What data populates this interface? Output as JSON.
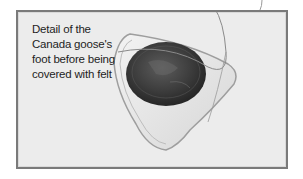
{
  "figure": {
    "caption_lines": [
      "Detail of the",
      "Canada goose's",
      "foot before being",
      "covered with felt"
    ],
    "colors": {
      "frame_border": "#7a7a7a",
      "background": "#ececec",
      "coin": "#3a3a3a"
    }
  }
}
